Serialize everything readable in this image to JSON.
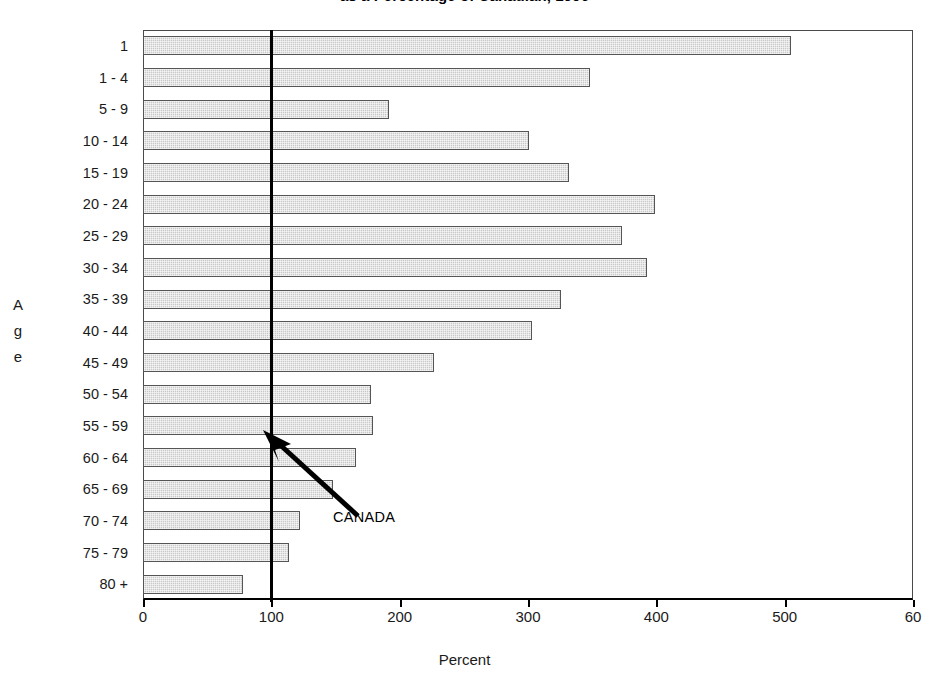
{
  "chart_data": {
    "type": "bar",
    "orientation": "horizontal",
    "title": "as a Percentage of Canadian, 1996",
    "xlabel": "Percent",
    "ylabel": "Age",
    "xlim": [
      0,
      600
    ],
    "xticks": [
      0,
      100,
      200,
      300,
      400,
      500,
      600
    ],
    "xtick_labels": [
      "0",
      "100",
      "200",
      "300",
      "400",
      "500",
      "60"
    ],
    "grid": false,
    "legend": null,
    "categories": [
      "1",
      "1 - 4",
      "5 - 9",
      "10 - 14",
      "15 - 19",
      "20 - 24",
      "25 - 29",
      "30 - 34",
      "35 - 39",
      "40 - 44",
      "45 - 49",
      "50 - 54",
      "55 - 59",
      "60 - 64",
      "65 - 69",
      "70 - 74",
      "75 - 79",
      "80 +"
    ],
    "values": [
      505,
      348,
      192,
      301,
      332,
      399,
      373,
      393,
      326,
      303,
      227,
      178,
      179,
      166,
      148,
      122,
      114,
      78
    ],
    "annotations": [
      {
        "label": "CANADA",
        "value": 100,
        "type": "reference-line",
        "color": "#000000"
      }
    ],
    "bar_color": "#c9c9c9",
    "bar_edge_color": "#555555"
  },
  "axis": {
    "y_title_letters": [
      "A",
      "g",
      "e"
    ]
  }
}
